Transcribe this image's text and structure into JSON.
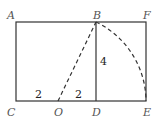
{
  "diagram": {
    "points": {
      "A": "A",
      "B": "B",
      "F": "F",
      "C": "C",
      "O": "O",
      "D": "D",
      "E": "E"
    },
    "measures": {
      "CO": "2",
      "OD": "2",
      "BD": "4"
    },
    "colors": {
      "stroke": "#333333",
      "label": "#555555"
    }
  }
}
